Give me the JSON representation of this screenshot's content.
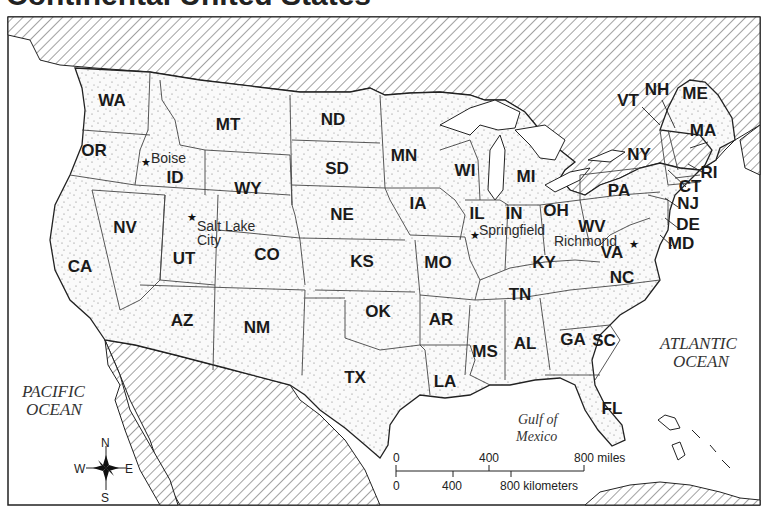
{
  "title": "Continental United States",
  "colors": {
    "land_fill": "#f4f4f4",
    "border": "#333333",
    "water": "#ffffff",
    "foreign_hatch": "#555555"
  },
  "states": [
    {
      "abbr": "WA",
      "x": 112,
      "y": 106
    },
    {
      "abbr": "OR",
      "x": 94,
      "y": 156
    },
    {
      "abbr": "CA",
      "x": 80,
      "y": 272
    },
    {
      "abbr": "NV",
      "x": 125,
      "y": 233
    },
    {
      "abbr": "ID",
      "x": 175,
      "y": 183
    },
    {
      "abbr": "MT",
      "x": 228,
      "y": 130
    },
    {
      "abbr": "WY",
      "x": 248,
      "y": 194
    },
    {
      "abbr": "UT",
      "x": 184,
      "y": 264
    },
    {
      "abbr": "CO",
      "x": 267,
      "y": 260
    },
    {
      "abbr": "AZ",
      "x": 182,
      "y": 326
    },
    {
      "abbr": "NM",
      "x": 257,
      "y": 333
    },
    {
      "abbr": "ND",
      "x": 333,
      "y": 125
    },
    {
      "abbr": "SD",
      "x": 337,
      "y": 174
    },
    {
      "abbr": "NE",
      "x": 342,
      "y": 220
    },
    {
      "abbr": "KS",
      "x": 362,
      "y": 267
    },
    {
      "abbr": "OK",
      "x": 378,
      "y": 317
    },
    {
      "abbr": "TX",
      "x": 355,
      "y": 383
    },
    {
      "abbr": "MN",
      "x": 404,
      "y": 161
    },
    {
      "abbr": "IA",
      "x": 418,
      "y": 209
    },
    {
      "abbr": "MO",
      "x": 438,
      "y": 268
    },
    {
      "abbr": "AR",
      "x": 441,
      "y": 325
    },
    {
      "abbr": "LA",
      "x": 445,
      "y": 387
    },
    {
      "abbr": "WI",
      "x": 465,
      "y": 176
    },
    {
      "abbr": "IL",
      "x": 477,
      "y": 219
    },
    {
      "abbr": "MI",
      "x": 526,
      "y": 182
    },
    {
      "abbr": "IN",
      "x": 514,
      "y": 219
    },
    {
      "abbr": "OH",
      "x": 556,
      "y": 216
    },
    {
      "abbr": "KY",
      "x": 544,
      "y": 268
    },
    {
      "abbr": "TN",
      "x": 520,
      "y": 300
    },
    {
      "abbr": "MS",
      "x": 485,
      "y": 357
    },
    {
      "abbr": "AL",
      "x": 525,
      "y": 349
    },
    {
      "abbr": "GA",
      "x": 573,
      "y": 345
    },
    {
      "abbr": "FL",
      "x": 612,
      "y": 414
    },
    {
      "abbr": "SC",
      "x": 604,
      "y": 346
    },
    {
      "abbr": "NC",
      "x": 622,
      "y": 283
    },
    {
      "abbr": "VA",
      "x": 612,
      "y": 258
    },
    {
      "abbr": "WV",
      "x": 592,
      "y": 232
    },
    {
      "abbr": "PA",
      "x": 619,
      "y": 196
    },
    {
      "abbr": "NY",
      "x": 639,
      "y": 160
    },
    {
      "abbr": "VT",
      "x": 628,
      "y": 106
    },
    {
      "abbr": "NH",
      "x": 657,
      "y": 95
    },
    {
      "abbr": "ME",
      "x": 695,
      "y": 99
    },
    {
      "abbr": "MA",
      "x": 703,
      "y": 136
    },
    {
      "abbr": "RI",
      "x": 709,
      "y": 178
    },
    {
      "abbr": "CT",
      "x": 690,
      "y": 192
    },
    {
      "abbr": "NJ",
      "x": 688,
      "y": 209
    },
    {
      "abbr": "DE",
      "x": 688,
      "y": 230
    },
    {
      "abbr": "MD",
      "x": 681,
      "y": 249
    }
  ],
  "cities": [
    {
      "name": "Boise",
      "line1": "Boise",
      "x": 151,
      "y": 163,
      "star_x": 145,
      "star_y": 162
    },
    {
      "name": "Salt Lake City",
      "line1": "Salt Lake",
      "line2": "City",
      "x": 197,
      "y": 231,
      "star_x": 191,
      "star_y": 217
    },
    {
      "name": "Springfield",
      "line1": "Springfield",
      "x": 479,
      "y": 235,
      "star_x": 474,
      "star_y": 235
    },
    {
      "name": "Richmond",
      "line1": "Richmond",
      "x": 554,
      "y": 246,
      "star_x": 633,
      "star_y": 244
    }
  ],
  "water_labels": {
    "pacific": {
      "line1": "PACIFIC",
      "line2": "OCEAN"
    },
    "atlantic": {
      "line1": "ATLANTIC",
      "line2": "OCEAN"
    },
    "gulf": {
      "line1": "Gulf of",
      "line2": "Mexico"
    }
  },
  "compass": {
    "n": "N",
    "s": "S",
    "e": "E",
    "w": "W"
  },
  "scale_bar": {
    "miles_ticks": [
      "0",
      "400",
      "800 miles"
    ],
    "km_ticks": [
      "0",
      "400",
      "800 kilometers"
    ]
  }
}
